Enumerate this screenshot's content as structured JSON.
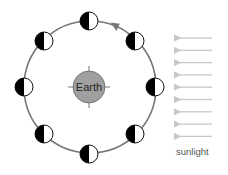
{
  "diagram": {
    "title": "",
    "earth": {
      "label": "Earth",
      "cx": 89,
      "cy": 87,
      "r": 16,
      "fill": "#a0a0a0"
    },
    "orbit": {
      "cx": 90,
      "cy": 87,
      "r": 66,
      "stroke": "#777777",
      "direction": "counterclockwise"
    },
    "moons": [
      {
        "position": "top",
        "cx": 89,
        "cy": 21,
        "lit_side": "right"
      },
      {
        "position": "top-right",
        "cx": 135,
        "cy": 41,
        "lit_side": "right"
      },
      {
        "position": "right",
        "cx": 155,
        "cy": 87,
        "lit_side": "right"
      },
      {
        "position": "bottom-right",
        "cx": 135,
        "cy": 134,
        "lit_side": "right"
      },
      {
        "position": "bottom",
        "cx": 89,
        "cy": 154,
        "lit_side": "right"
      },
      {
        "position": "bottom-left",
        "cx": 44,
        "cy": 134,
        "lit_side": "right"
      },
      {
        "position": "left",
        "cx": 24,
        "cy": 87,
        "lit_side": "right"
      },
      {
        "position": "top-left",
        "cx": 44,
        "cy": 41,
        "lit_side": "right"
      }
    ],
    "moon_radius": 9,
    "sunlight": {
      "label": "sunlight",
      "arrow_count": 9,
      "arrow_color": "#c8c8c8",
      "direction": "left"
    }
  }
}
